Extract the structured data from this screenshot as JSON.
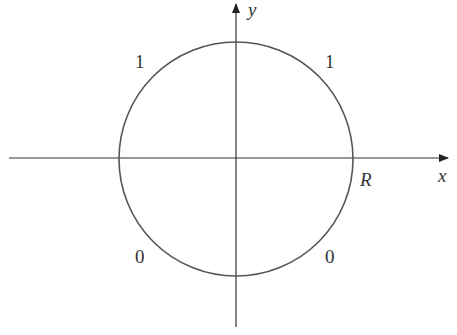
{
  "diagram": {
    "axes": {
      "x_label": "x",
      "y_label": "y"
    },
    "circle": {
      "radius_label": "R",
      "center": [
        236,
        158
      ],
      "radius_px": 116
    },
    "boundary_values": {
      "upper_left": "1",
      "upper_right": "1",
      "lower_left": "0",
      "lower_right": "0"
    },
    "colors": {
      "stroke": "#555555",
      "axis": "#333333"
    }
  }
}
